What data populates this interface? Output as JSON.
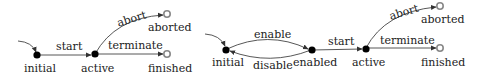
{
  "diagrams": [
    {
      "nodes": {
        "initial": {
          "label": "initial"
        },
        "active": {
          "label": "active"
        },
        "aborted": {
          "label": "aborted"
        },
        "finished": {
          "label": "finished"
        }
      },
      "edges": {
        "start": {
          "label": "start"
        },
        "abort": {
          "label": "abort"
        },
        "terminate": {
          "label": "terminate"
        }
      }
    },
    {
      "nodes": {
        "initial": {
          "label": "initial"
        },
        "enabled": {
          "label": "enabled"
        },
        "active": {
          "label": "active"
        },
        "aborted": {
          "label": "aborted"
        },
        "finished": {
          "label": "finished"
        }
      },
      "edges": {
        "enable": {
          "label": "enable"
        },
        "disable": {
          "label": "disable"
        },
        "start": {
          "label": "start"
        },
        "abort": {
          "label": "abort"
        },
        "terminate": {
          "label": "terminate"
        }
      }
    }
  ]
}
